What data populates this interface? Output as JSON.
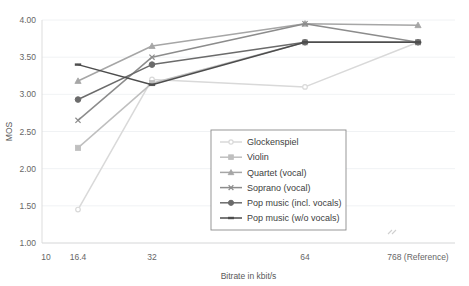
{
  "chart_data": {
    "type": "line",
    "title": "",
    "xlabel": "Bitrate in kbit/s",
    "ylabel": "MOS",
    "x_scale": "log-with-break",
    "x_tick_labels": [
      "10",
      "16.4",
      "32",
      "64",
      "768 (Reference)"
    ],
    "categories": [
      "16.4",
      "32",
      "64",
      "768 (Reference)"
    ],
    "ylim": [
      1.0,
      4.0
    ],
    "y_tick_labels": [
      "1.00",
      "1.50",
      "2.00",
      "2.50",
      "3.00",
      "3.50",
      "4.00"
    ],
    "y_tick_values": [
      1.0,
      1.5,
      2.0,
      2.5,
      3.0,
      3.5,
      4.0
    ],
    "grid": true,
    "legend_position": "center",
    "series": [
      {
        "name": "Glockenspiel",
        "color": "#d9d9d9",
        "marker": "circle",
        "values": [
          1.45,
          3.2,
          3.1,
          3.7
        ]
      },
      {
        "name": "Violin",
        "color": "#bfbfbf",
        "marker": "square",
        "values": [
          2.28,
          3.15,
          3.7,
          3.7
        ]
      },
      {
        "name": "Quartet (vocal)",
        "color": "#a6a6a6",
        "marker": "triangle",
        "values": [
          3.18,
          3.65,
          3.95,
          3.93
        ]
      },
      {
        "name": "Soprano (vocal)",
        "color": "#8c8c8c",
        "marker": "cross",
        "values": [
          2.65,
          3.5,
          3.95,
          3.7
        ]
      },
      {
        "name": "Pop music (incl. vocals)",
        "color": "#6b6b6b",
        "marker": "circle-filled",
        "values": [
          2.93,
          3.4,
          3.7,
          3.7
        ]
      },
      {
        "name": "Pop music (w/o vocals)",
        "color": "#4d4d4d",
        "marker": "dash",
        "values": [
          3.4,
          3.13,
          3.7,
          3.7
        ]
      }
    ]
  }
}
